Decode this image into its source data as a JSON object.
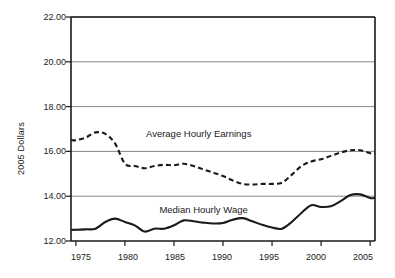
{
  "chart_data": {
    "type": "line",
    "title": "",
    "xlabel": "",
    "ylabel": "2005 Dollars",
    "xlim": [
      1974.5,
      2005.5
    ],
    "ylim": [
      12.0,
      22.0
    ],
    "grid": true,
    "legend_position": "inline-annotations",
    "xticks": [
      1975,
      1980,
      1985,
      1990,
      1995,
      2000,
      2005
    ],
    "xtick_labels": [
      "1975",
      "1980",
      "1985",
      "1990",
      "1995",
      "2000",
      "2005"
    ],
    "yticks": [
      12.0,
      14.0,
      16.0,
      18.0,
      20.0,
      22.0
    ],
    "ytick_labels": [
      "12.00",
      "14.00",
      "16.00",
      "18.00",
      "20.00",
      "22.00"
    ],
    "x": [
      1975,
      1976,
      1977,
      1978,
      1979,
      1980,
      1981,
      1982,
      1983,
      1984,
      1985,
      1986,
      1987,
      1988,
      1989,
      1990,
      1991,
      1992,
      1993,
      1994,
      1995,
      1996,
      1997,
      1998,
      1999,
      2000,
      2001,
      2002,
      2003,
      2004,
      2005
    ],
    "series": [
      {
        "name": "Average Hourly Earnings",
        "style": "dashed",
        "color": "#1a1a1a",
        "annotation": "Average Hourly Earnings",
        "values": [
          16.5,
          16.62,
          16.85,
          16.78,
          16.35,
          15.45,
          15.35,
          15.25,
          15.35,
          15.4,
          15.38,
          15.45,
          15.35,
          15.2,
          15.05,
          14.9,
          14.7,
          14.55,
          14.52,
          14.55,
          14.55,
          14.6,
          14.95,
          15.35,
          15.55,
          15.65,
          15.8,
          15.95,
          16.05,
          16.05,
          15.92
        ]
      },
      {
        "name": "Median Hourly Wage",
        "style": "solid",
        "color": "#1a1a1a",
        "annotation": "Median Hourly Wage",
        "values": [
          12.5,
          12.52,
          12.55,
          12.85,
          13.0,
          12.85,
          12.7,
          12.42,
          12.55,
          12.55,
          12.7,
          12.92,
          12.88,
          12.82,
          12.78,
          12.8,
          12.95,
          13.02,
          12.88,
          12.72,
          12.6,
          12.55,
          12.85,
          13.25,
          13.6,
          13.52,
          13.55,
          13.78,
          14.05,
          14.08,
          13.92
        ]
      }
    ],
    "annotations": [
      {
        "text": "Average Hourly Earnings",
        "x": 1987.5,
        "y": 16.75
      },
      {
        "text": "Median Hourly Wage",
        "x": 1988.0,
        "y": 13.35
      }
    ],
    "colors": {
      "axis": "#1a1a1a",
      "grid": "#888888",
      "line": "#1a1a1a",
      "background": "#ffffff"
    }
  }
}
